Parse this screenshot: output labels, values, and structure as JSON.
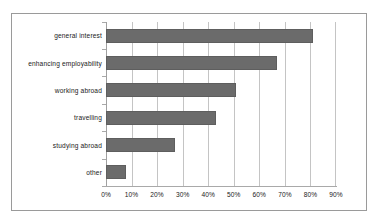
{
  "chart_data": {
    "type": "bar",
    "orientation": "horizontal",
    "title": "",
    "subtitle": "",
    "xlabel": "",
    "ylabel": "",
    "categories": [
      "general interest",
      "enhancing employability",
      "working abroad",
      "travelling",
      "studying abroad",
      "other"
    ],
    "values": [
      81,
      67,
      51,
      43,
      27,
      8
    ],
    "value_unit": "%",
    "xlim": [
      0,
      90
    ],
    "xticks": [
      0,
      10,
      20,
      30,
      40,
      50,
      60,
      70,
      80,
      90
    ],
    "xtick_labels": [
      "0%",
      "10%",
      "20%",
      "30%",
      "40%",
      "50%",
      "60%",
      "70%",
      "80%",
      "90%"
    ],
    "grid": "vertical",
    "legend": null,
    "legend_position": "none",
    "series": [
      {
        "name": "share of respondents",
        "values": [
          81,
          67,
          51,
          43,
          27,
          8
        ]
      }
    ],
    "colors": {
      "bar_fill": "#6b6b6b",
      "bar_edge": "#5e5e5e",
      "gridline": "#c4c4c4",
      "axis": "#a0a0a0",
      "frame": "#9a9a9a",
      "text": "#1a1a1a",
      "background": "#ffffff"
    }
  }
}
